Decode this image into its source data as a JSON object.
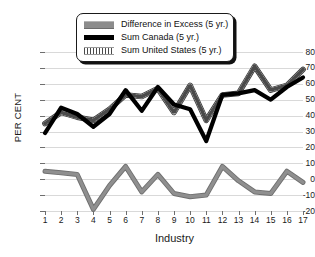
{
  "chart_data": {
    "type": "line",
    "title": "",
    "xlabel": "Industry",
    "ylabel": "PER CENT",
    "ylim": [
      -20,
      80
    ],
    "ytick_step": 10,
    "yticks": [
      80,
      70,
      60,
      50,
      40,
      30,
      20,
      10,
      0,
      -10,
      -20
    ],
    "xticks": [
      1,
      2,
      3,
      4,
      5,
      6,
      7,
      8,
      9,
      10,
      11,
      12,
      13,
      14,
      15,
      16,
      17
    ],
    "categories": [
      1,
      2,
      3,
      4,
      5,
      6,
      7,
      8,
      9,
      10,
      11,
      12,
      13,
      14,
      15,
      16,
      17
    ],
    "grid": true,
    "grid_color": "#d9d9d9",
    "legend_position": "top-center",
    "series": [
      {
        "name": "Difference in Excess (5 yr.)",
        "color": "#8c8c8c",
        "style": "thick-gray",
        "values": [
          5,
          4,
          3,
          -19,
          -4,
          8,
          -8,
          3,
          -9,
          -11,
          -10,
          8,
          -1,
          -8,
          -9,
          5,
          -2
        ]
      },
      {
        "name": "Sum Canada (5 yr.)",
        "color": "#000000",
        "style": "thick-black",
        "values": [
          29,
          45,
          41,
          33,
          41,
          56,
          43,
          58,
          47,
          44,
          24,
          53,
          54,
          56,
          50,
          58,
          64
        ]
      },
      {
        "name": "Sum United States (5 yr.)",
        "color": "#bdbdbd",
        "style": "hatched-gray",
        "values": [
          35,
          42,
          39,
          37,
          44,
          53,
          52,
          57,
          42,
          59,
          37,
          53,
          54,
          71,
          56,
          59,
          69
        ]
      }
    ]
  },
  "legend": {
    "items": [
      {
        "label": "Difference in Excess (5 yr.)",
        "swatch": "diff"
      },
      {
        "label": "Sum Canada (5 yr.)",
        "swatch": "canada"
      },
      {
        "label": "Sum United States (5 yr.)",
        "swatch": "us"
      }
    ]
  },
  "axes": {
    "y_title": "PER CENT",
    "x_title": "Industry"
  }
}
